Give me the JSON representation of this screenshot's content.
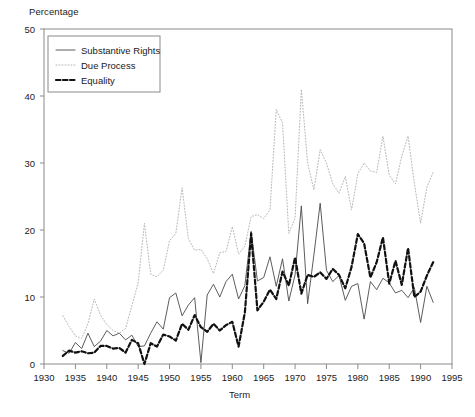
{
  "chart_data": {
    "type": "line",
    "title": "",
    "xlabel": "Term",
    "ylabel": "Percentage",
    "xlim": [
      1930,
      1995
    ],
    "ylim": [
      0,
      50
    ],
    "grid": false,
    "legend_position": "top-left",
    "xticks": [
      1930,
      1935,
      1940,
      1945,
      1950,
      1955,
      1960,
      1965,
      1970,
      1975,
      1980,
      1985,
      1990,
      1995
    ],
    "yticks": [
      0,
      10,
      20,
      30,
      40,
      50
    ],
    "x": [
      1933,
      1934,
      1935,
      1936,
      1937,
      1938,
      1939,
      1940,
      1941,
      1942,
      1943,
      1944,
      1945,
      1946,
      1947,
      1948,
      1949,
      1950,
      1951,
      1952,
      1953,
      1954,
      1955,
      1956,
      1957,
      1958,
      1959,
      1960,
      1961,
      1962,
      1963,
      1964,
      1965,
      1966,
      1967,
      1968,
      1969,
      1970,
      1971,
      1972,
      1973,
      1974,
      1975,
      1976,
      1977,
      1978,
      1979,
      1980,
      1981,
      1982,
      1983,
      1984,
      1985,
      1986,
      1987,
      1988,
      1989,
      1990,
      1991,
      1992
    ],
    "series": [
      {
        "name": "Substantive Rights",
        "style": "solid",
        "color": "#4a4a4a",
        "values": [
          2.0,
          1.6,
          3.2,
          2.3,
          4.6,
          2.6,
          3.4,
          5.0,
          4.2,
          4.6,
          3.6,
          4.3,
          2.6,
          2.7,
          4.6,
          6.3,
          5.2,
          9.9,
          10.6,
          7.2,
          8.8,
          9.9,
          0.2,
          10.3,
          11.9,
          10.0,
          12.3,
          13.4,
          9.7,
          11.7,
          19.8,
          12.4,
          12.9,
          16.0,
          11.6,
          15.7,
          9.4,
          13.3,
          23.6,
          9.0,
          16.3,
          24.0,
          14.0,
          12.3,
          13.2,
          9.5,
          11.6,
          12.0,
          6.7,
          12.3,
          11.1,
          12.8,
          12.1,
          10.6,
          11.0,
          9.9,
          11.4,
          6.2,
          11.6,
          9.2
        ]
      },
      {
        "name": "Due Process",
        "style": "dotted",
        "color": "#b6b6b6",
        "values": [
          7.2,
          5.6,
          4.2,
          3.8,
          6.0,
          9.7,
          7.3,
          5.9,
          5.0,
          4.6,
          5.3,
          8.7,
          12.1,
          21.0,
          13.4,
          13.0,
          14.0,
          18.4,
          19.5,
          26.3,
          18.7,
          17.0,
          17.1,
          15.7,
          13.5,
          16.6,
          16.8,
          20.5,
          16.4,
          17.6,
          22.0,
          22.3,
          21.7,
          23.0,
          38.0,
          36.0,
          19.5,
          21.8,
          41.0,
          30.0,
          26.0,
          32.0,
          30.0,
          26.9,
          25.5,
          28.0,
          23.0,
          28.4,
          30.0,
          28.8,
          28.6,
          34.0,
          28.2,
          26.9,
          31.0,
          34.0,
          27.0,
          21.0,
          26.4,
          28.6
        ]
      },
      {
        "name": "Equality",
        "style": "dashed",
        "color": "#111111",
        "values": [
          1.2,
          2.0,
          1.7,
          1.9,
          1.6,
          1.7,
          2.7,
          2.7,
          2.3,
          2.4,
          1.7,
          3.6,
          3.1,
          0.0,
          3.1,
          2.6,
          4.4,
          4.1,
          3.5,
          6.0,
          5.1,
          7.3,
          5.5,
          4.8,
          6.0,
          5.0,
          5.8,
          6.3,
          2.6,
          7.7,
          19.5,
          8.0,
          9.3,
          11.1,
          9.7,
          13.8,
          11.7,
          15.9,
          10.5,
          13.3,
          13.0,
          13.7,
          12.7,
          14.2,
          13.3,
          11.3,
          14.5,
          19.4,
          18.0,
          12.9,
          15.2,
          18.9,
          12.0,
          15.4,
          11.8,
          17.3,
          10.0,
          10.8,
          13.2,
          15.2
        ]
      }
    ]
  },
  "axes": {
    "ylabel": "Percentage",
    "xlabel": "Term",
    "xticklabels": [
      "1930",
      "1935",
      "1940",
      "1945",
      "1950",
      "1955",
      "1960",
      "1965",
      "1970",
      "1975",
      "1980",
      "1985",
      "1990",
      "1995"
    ],
    "yticklabels": [
      "0",
      "10",
      "20",
      "30",
      "40",
      "50"
    ]
  },
  "legend": {
    "items": [
      {
        "label": "Substantive Rights"
      },
      {
        "label": "Due Process"
      },
      {
        "label": "Equality"
      }
    ]
  }
}
